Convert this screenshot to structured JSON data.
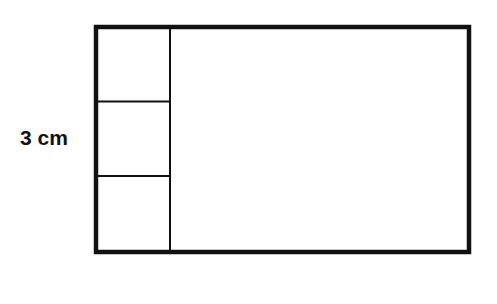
{
  "diagram": {
    "label": "3 cm",
    "stroke_color": "#111111",
    "background": "#ffffff",
    "outer_rect": {
      "x": 96,
      "y": 27,
      "width": 373,
      "height": 225
    },
    "left_column": {
      "x_right": 170,
      "rows": 3
    },
    "row_dividers_y": [
      101,
      176
    ]
  }
}
